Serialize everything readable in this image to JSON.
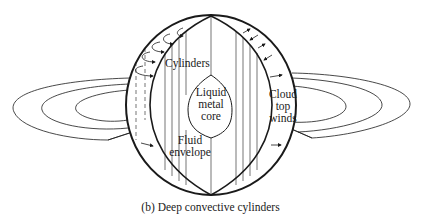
{
  "figure": {
    "caption": "(b)  Deep convective cylinders",
    "labels": {
      "cylinders": "Cylinders",
      "core_line1": "Liquid",
      "core_line2": "metal",
      "core_line3": "core",
      "envelope_line1": "Fluid",
      "envelope_line2": "envelope",
      "winds_line1": "Cloud",
      "winds_line2": "top",
      "winds_line3": "winds"
    },
    "colors": {
      "stroke": "#1a1a1a",
      "background": "#ffffff"
    }
  }
}
